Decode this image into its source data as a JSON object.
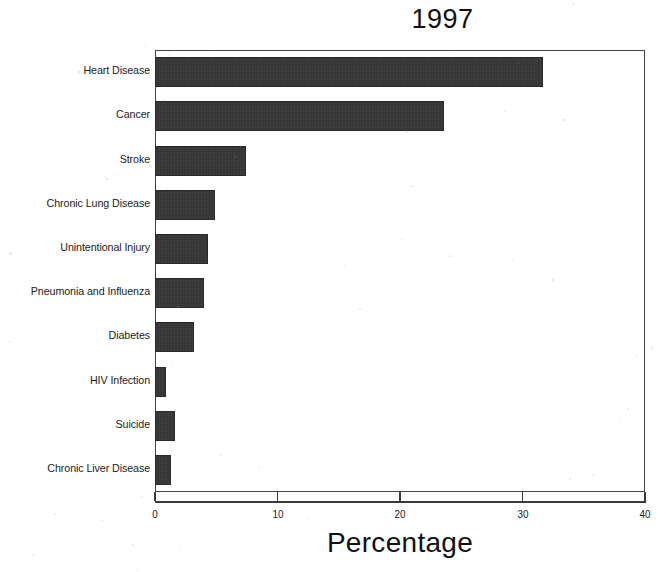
{
  "chart_data": {
    "type": "bar",
    "orientation": "horizontal",
    "title": "1997",
    "xlabel": "Percentage",
    "ylabel": "",
    "xlim": [
      0,
      40
    ],
    "xticks": [
      0,
      10,
      20,
      30,
      40
    ],
    "xtick_labels": [
      "0",
      "10",
      "20",
      "30",
      "40"
    ],
    "grid": false,
    "legend": null,
    "bar_color": "#333333",
    "categories": [
      "Heart Disease",
      "Cancer",
      "Stroke",
      "Chronic Lung Disease",
      "Unintentional Injury",
      "Pneumonia and Influenza",
      "Diabetes",
      "HIV Infection",
      "Suicide",
      "Chronic Liver Disease"
    ],
    "values": [
      31.7,
      23.6,
      7.4,
      4.9,
      4.3,
      4.0,
      3.2,
      0.9,
      1.6,
      1.3
    ]
  }
}
